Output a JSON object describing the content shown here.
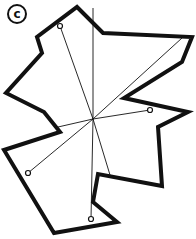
{
  "figure": {
    "label": "c",
    "colors": {
      "stroke": "#111111",
      "background": "#ffffff"
    },
    "polygon": {
      "points": "77,7 103,33 192,37 182,62 124,98 188,112 158,127 162,186 98,174 93,202 117,222 54,233 4,150 60,132 44,112 6,93 42,53 37,37 77,7",
      "stroke_width": 4
    },
    "center": {
      "x": 93,
      "y": 119
    },
    "rays": [
      {
        "x": 60,
        "y": 26,
        "marker": true
      },
      {
        "x": 93,
        "y": 8,
        "marker": false
      },
      {
        "x": 182,
        "y": 38,
        "marker": false
      },
      {
        "x": 150,
        "y": 110,
        "marker": true
      },
      {
        "x": 28,
        "y": 173,
        "marker": true
      },
      {
        "x": 91,
        "y": 219,
        "marker": true
      },
      {
        "x": 110,
        "y": 175,
        "marker": false
      },
      {
        "x": 58,
        "y": 127,
        "marker": false
      }
    ]
  }
}
